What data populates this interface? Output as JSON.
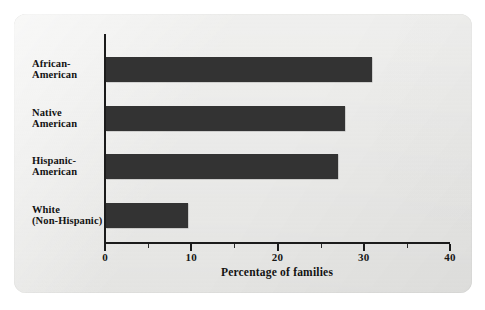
{
  "chart_data": {
    "type": "bar",
    "orientation": "horizontal",
    "title": "",
    "xlabel": "Percentage of families",
    "ylabel": "",
    "categories": [
      "African-American",
      "Native American",
      "Hispanic-American",
      "White (Non-Hispanic)"
    ],
    "category_lines": [
      [
        "African-",
        "American"
      ],
      [
        "Native",
        "American"
      ],
      [
        "Hispanic-",
        "American"
      ],
      [
        "White",
        "(Non-Hispanic)"
      ]
    ],
    "values": [
      31,
      27.8,
      27,
      9.6
    ],
    "xlim": [
      0,
      40
    ],
    "xticks": [
      0,
      10,
      20,
      30,
      40
    ],
    "xtick_labels": [
      "0",
      "10",
      "20",
      "30",
      "40"
    ],
    "minor_xticks": [
      5,
      15,
      25,
      35
    ],
    "grid": false,
    "legend": false,
    "bar_color": "#333333",
    "panel_color": "#e9e9e7",
    "axis_color": "#1b1b1b"
  }
}
